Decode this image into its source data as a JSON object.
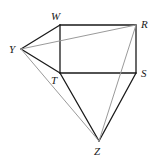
{
  "diagram": {
    "type": "geometry-figure",
    "points": {
      "W": {
        "label": "W",
        "x": 60,
        "y": 25,
        "lx": 51,
        "ly": 20
      },
      "R": {
        "label": "R",
        "x": 136,
        "y": 25,
        "lx": 141,
        "ly": 28
      },
      "Y": {
        "label": "Y",
        "x": 21,
        "y": 49,
        "lx": 9,
        "ly": 53
      },
      "T": {
        "label": "T",
        "x": 60,
        "y": 73,
        "lx": 51,
        "ly": 84
      },
      "S": {
        "label": "S",
        "x": 136,
        "y": 73,
        "lx": 141,
        "ly": 77
      },
      "Z": {
        "label": "Z",
        "x": 99,
        "y": 141,
        "lx": 94,
        "ly": 155
      }
    },
    "segments": [
      {
        "from": "Y",
        "to": "W",
        "style": "solid"
      },
      {
        "from": "W",
        "to": "R",
        "style": "solid"
      },
      {
        "from": "W",
        "to": "T",
        "style": "solid"
      },
      {
        "from": "R",
        "to": "S",
        "style": "solid"
      },
      {
        "from": "T",
        "to": "S",
        "style": "solid"
      },
      {
        "from": "Y",
        "to": "T",
        "style": "solid"
      },
      {
        "from": "T",
        "to": "Z",
        "style": "solid"
      },
      {
        "from": "S",
        "to": "Z",
        "style": "solid"
      },
      {
        "from": "Y",
        "to": "R",
        "style": "light"
      },
      {
        "from": "Y",
        "to": "Z",
        "style": "light"
      },
      {
        "from": "R",
        "to": "Z",
        "style": "light"
      }
    ],
    "colors": {
      "solid": "#1a1a1a",
      "light": "#9a9a9a"
    }
  }
}
